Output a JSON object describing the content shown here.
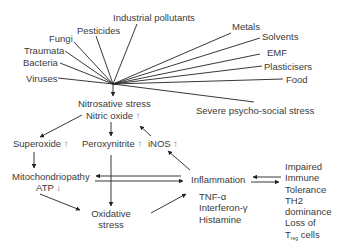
{
  "diagram": {
    "type": "flow",
    "sources_left": [
      {
        "id": "industrial-pollutants",
        "label": "Industrial pollutants"
      },
      {
        "id": "pesticides",
        "label": "Pesticides"
      },
      {
        "id": "fungi",
        "label": "Fungi"
      },
      {
        "id": "traumata",
        "label": "Traumata"
      },
      {
        "id": "bacteria",
        "label": "Bacteria"
      },
      {
        "id": "viruses",
        "label": "Viruses"
      }
    ],
    "sources_right": [
      {
        "id": "metals",
        "label": "Metals"
      },
      {
        "id": "solvents",
        "label": "Solvents"
      },
      {
        "id": "emf",
        "label": "EMF"
      },
      {
        "id": "plasticisers",
        "label": "Plasticisers"
      },
      {
        "id": "food",
        "label": "Food"
      },
      {
        "id": "psycho-social-stress",
        "label": "Severe psycho-social stress"
      }
    ],
    "nodes": {
      "nitrosative": {
        "line1": "Nitrosative stress",
        "line2": "Nitric oxide",
        "line2_arrow": "↑"
      },
      "superoxide": {
        "label": "Superoxide",
        "arrow": "↑"
      },
      "peroxynitrite": {
        "label": "Peroxynitrite",
        "arrow": "↑"
      },
      "inos": {
        "label": "iNOS",
        "arrow": "↑"
      },
      "mitochondriopathy": {
        "line1": "Mitochondriopathy",
        "line2": "ATP",
        "line2_arrow": "↓"
      },
      "oxidative": {
        "line1": "Oxidative",
        "line2": "stress"
      },
      "inflammation": {
        "label": "Inflammation"
      },
      "mediators": [
        "TNF-α",
        "Interferon-γ",
        "Histamine"
      ],
      "immune": {
        "lines": [
          "Impaired",
          "Immune",
          "Tolerance",
          "TH2",
          "dominance",
          "Loss of"
        ],
        "last_main": "T",
        "last_sub": "reg",
        "last_tail": " cells"
      }
    },
    "edges": [
      [
        "all sources",
        "nitrosative"
      ],
      [
        "nitrosative",
        "superoxide"
      ],
      [
        "nitrosative",
        "peroxynitrite"
      ],
      [
        "inos",
        "nitrosative"
      ],
      [
        "inflammation",
        "inos"
      ],
      [
        "superoxide",
        "mitochondriopathy"
      ],
      [
        "peroxynitrite",
        "oxidative"
      ],
      [
        "mitochondriopathy",
        "oxidative"
      ],
      [
        "inflammation",
        "mitochondriopathy"
      ],
      [
        "mitochondriopathy",
        "inflammation"
      ],
      [
        "oxidative",
        "inflammation"
      ],
      [
        "immune",
        "inflammation"
      ],
      [
        "inflammation",
        "immune"
      ]
    ]
  }
}
